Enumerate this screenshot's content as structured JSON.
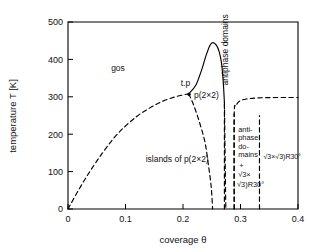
{
  "chart_data": {
    "type": "line",
    "title": "",
    "xlabel": "coverage θ",
    "ylabel": "temperature T [K]",
    "xlim": [
      0,
      0.4
    ],
    "ylim": [
      0,
      500
    ],
    "xticks": [
      "0",
      "0.1",
      "0.2",
      "0.3",
      "0.4"
    ],
    "xtick_values": [
      0,
      0.1,
      0.2,
      0.3,
      0.4
    ],
    "yticks": [
      "0",
      "100",
      "200",
      "300",
      "400",
      "500"
    ],
    "ytick_values": [
      0,
      100,
      200,
      300,
      400,
      500
    ],
    "grid": false,
    "legend": "none",
    "series": [
      {
        "name": "gas / islands phase boundary (dashed)",
        "style": "dashed",
        "points": [
          [
            0.0,
            0
          ],
          [
            0.02,
            55
          ],
          [
            0.04,
            105
          ],
          [
            0.06,
            150
          ],
          [
            0.08,
            190
          ],
          [
            0.1,
            222
          ],
          [
            0.12,
            248
          ],
          [
            0.14,
            268
          ],
          [
            0.16,
            285
          ],
          [
            0.18,
            297
          ],
          [
            0.2,
            305
          ],
          [
            0.21,
            308
          ]
        ]
      },
      {
        "name": "p(2x2) order-disorder peak (solid)",
        "style": "solid",
        "points": [
          [
            0.21,
            308
          ],
          [
            0.222,
            330
          ],
          [
            0.232,
            370
          ],
          [
            0.24,
            410
          ],
          [
            0.247,
            438
          ],
          [
            0.252,
            445
          ],
          [
            0.258,
            438
          ],
          [
            0.263,
            420
          ],
          [
            0.267,
            390
          ],
          [
            0.27,
            340
          ],
          [
            0.272,
            285
          ]
        ]
      },
      {
        "name": "right descending branch of peak (dashed)",
        "style": "dashed",
        "points": [
          [
            0.272,
            285
          ],
          [
            0.2725,
            230
          ],
          [
            0.273,
            170
          ],
          [
            0.2735,
            110
          ],
          [
            0.274,
            50
          ],
          [
            0.2745,
            0
          ]
        ]
      },
      {
        "name": "left descending branch below triple point (dashed)",
        "style": "dashed",
        "points": [
          [
            0.21,
            308
          ],
          [
            0.218,
            280
          ],
          [
            0.228,
            235
          ],
          [
            0.238,
            180
          ],
          [
            0.244,
            120
          ],
          [
            0.249,
            60
          ],
          [
            0.2515,
            0
          ]
        ]
      },
      {
        "name": "antiphase-domain / sqrt3 boundary (dashed)",
        "style": "dashed",
        "points": [
          [
            0.289,
            0
          ],
          [
            0.289,
            250
          ],
          [
            0.292,
            275
          ],
          [
            0.298,
            288
          ],
          [
            0.31,
            294
          ],
          [
            0.33,
            297
          ],
          [
            0.36,
            298
          ],
          [
            0.4,
            298
          ]
        ]
      },
      {
        "name": "vertical boundary at 0.272 (dashed)",
        "style": "dashed",
        "points": [
          [
            0.272,
            0
          ],
          [
            0.272,
            285
          ]
        ]
      },
      {
        "name": "vertical boundary at 0.289 (dashed)",
        "style": "dashed",
        "points": [
          [
            0.289,
            0
          ],
          [
            0.289,
            255
          ]
        ]
      },
      {
        "name": "vertical boundary at 0.333 (dashed)",
        "style": "dashed",
        "points": [
          [
            0.333,
            0
          ],
          [
            0.333,
            250
          ]
        ]
      }
    ],
    "annotations": [
      {
        "text": "gos",
        "x": 0.075,
        "y": 370,
        "orientation": "horizontal"
      },
      {
        "text": "t.p",
        "x": 0.196,
        "y": 330,
        "orientation": "horizontal"
      },
      {
        "text": "p(2×2)",
        "x": 0.219,
        "y": 297,
        "orientation": "horizontal"
      },
      {
        "text": "islands of p(2×2)",
        "x": 0.135,
        "y": 125,
        "orientation": "horizontal"
      },
      {
        "text": "antiphase domains",
        "x": 0.278,
        "y": 330,
        "orientation": "vertical"
      },
      {
        "text": "anti-",
        "x": 0.296,
        "y": 205,
        "orientation": "horizontal"
      },
      {
        "text": "phase",
        "x": 0.296,
        "y": 185,
        "orientation": "horizontal"
      },
      {
        "text": "do-",
        "x": 0.296,
        "y": 160,
        "orientation": "horizontal"
      },
      {
        "text": "mains",
        "x": 0.296,
        "y": 140,
        "orientation": "horizontal"
      },
      {
        "text": "+",
        "x": 0.298,
        "y": 110,
        "orientation": "horizontal"
      },
      {
        "text": "√3×",
        "x": 0.296,
        "y": 85,
        "orientation": "horizontal"
      },
      {
        "text": "√3)R30°",
        "x": 0.294,
        "y": 60,
        "orientation": "horizontal"
      },
      {
        "text": "√3×√3)R30°",
        "x": 0.34,
        "y": 135,
        "orientation": "horizontal"
      }
    ]
  },
  "axes": {
    "ylabel": "temperature T [K]",
    "xlabel": "coverage θ",
    "ytick_labels": [
      "500",
      "400",
      "300",
      "200",
      "100",
      "0"
    ],
    "xtick_labels": [
      "0",
      "0.1",
      "0.2",
      "0.3",
      "0.4"
    ]
  },
  "labels": {
    "gas": "gos",
    "triple_point": "t.p",
    "p2x2": "p(2×2)",
    "islands": "islands of p(2×2)",
    "antiphase_vertical": "antiphase domains",
    "anti": "anti-",
    "phase": "phase",
    "do": "do-",
    "mains": "mains",
    "plus": "+",
    "sqrt3a": "√3×",
    "sqrt3b": "√3)R30°",
    "sqrt3_right": "√3×√3)R30°"
  },
  "colors": {
    "line": "#000000",
    "axis": "#000000",
    "background": "#ffffff"
  }
}
